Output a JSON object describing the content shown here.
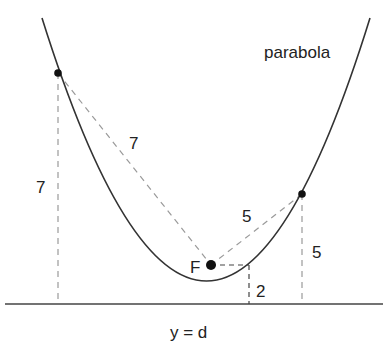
{
  "diagram": {
    "curve_label": "parabola",
    "focus_label": "F",
    "directrix_label": "y = d",
    "distances": {
      "left_to_focus": "7",
      "left_to_directrix": "7",
      "right_to_focus": "5",
      "right_to_directrix": "5",
      "vertex_side_to_directrix": "2"
    },
    "colors": {
      "curve": "#333333",
      "dashed": "#999999",
      "points": "#111111",
      "text": "#222222"
    }
  }
}
